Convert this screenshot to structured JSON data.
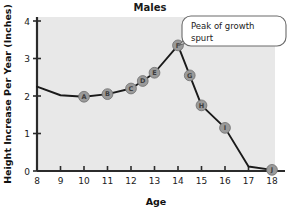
{
  "chart_data": {
    "type": "line",
    "title": "Males",
    "xlabel": "Age",
    "ylabel": "Height Increase Per Year (Inches)",
    "xlim": [
      8,
      18
    ],
    "ylim": [
      0,
      4
    ],
    "xticks": [
      "8",
      "9",
      "10",
      "11",
      "12",
      "13",
      "14",
      "15",
      "16",
      "17",
      "18"
    ],
    "yticks": [
      "0",
      "1",
      "2",
      "3",
      "4"
    ],
    "grid": false,
    "legend": "none",
    "x": [
      8,
      9,
      10,
      11,
      12,
      12.5,
      13,
      14,
      14.5,
      15,
      16,
      17,
      18
    ],
    "values": [
      2.25,
      2.02,
      1.98,
      2.05,
      2.2,
      2.4,
      2.62,
      3.35,
      2.55,
      1.75,
      1.15,
      0.12,
      0.03
    ],
    "point_labels": [
      {
        "label": "A",
        "x": 10,
        "y": 1.98
      },
      {
        "label": "B",
        "x": 11,
        "y": 2.05
      },
      {
        "label": "C",
        "x": 12,
        "y": 2.2
      },
      {
        "label": "D",
        "x": 12.5,
        "y": 2.4
      },
      {
        "label": "E",
        "x": 13,
        "y": 2.62
      },
      {
        "label": "F",
        "x": 14,
        "y": 3.35
      },
      {
        "label": "G",
        "x": 14.5,
        "y": 2.55
      },
      {
        "label": "H",
        "x": 15,
        "y": 1.75
      },
      {
        "label": "I",
        "x": 16,
        "y": 1.15
      },
      {
        "label": "J",
        "x": 18,
        "y": 0.03
      }
    ],
    "annotations": [
      {
        "text_line1": "Peak of growth",
        "text_line2": "spurt",
        "points_to": "F"
      }
    ],
    "colors": {
      "plot_background": "#e8e8e8",
      "line": "#1a1a1a",
      "marker_fill": "#9a9a9a",
      "marker_stroke": "#6e6e6e",
      "axis": "#2b2b2b",
      "callout_border": "#6a6a6a",
      "callout_fill": "#ffffff"
    }
  }
}
